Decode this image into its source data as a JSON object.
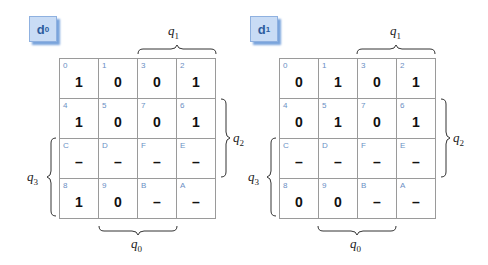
{
  "maps": [
    {
      "name": "d",
      "sub": "0",
      "cells": [
        [
          {
            "idx": "0",
            "val": "1"
          },
          {
            "idx": "1",
            "val": "0"
          },
          {
            "idx": "3",
            "val": "0"
          },
          {
            "idx": "2",
            "val": "1"
          }
        ],
        [
          {
            "idx": "4",
            "val": "1"
          },
          {
            "idx": "5",
            "val": "0"
          },
          {
            "idx": "7",
            "val": "0"
          },
          {
            "idx": "6",
            "val": "1"
          }
        ],
        [
          {
            "idx": "C",
            "val": "–"
          },
          {
            "idx": "D",
            "val": "–"
          },
          {
            "idx": "F",
            "val": "–"
          },
          {
            "idx": "E",
            "val": "–"
          }
        ],
        [
          {
            "idx": "8",
            "val": "1"
          },
          {
            "idx": "9",
            "val": "0"
          },
          {
            "idx": "B",
            "val": "–"
          },
          {
            "idx": "A",
            "val": "–"
          }
        ]
      ]
    },
    {
      "name": "d",
      "sub": "1",
      "cells": [
        [
          {
            "idx": "0",
            "val": "0"
          },
          {
            "idx": "1",
            "val": "1"
          },
          {
            "idx": "3",
            "val": "0"
          },
          {
            "idx": "2",
            "val": "1"
          }
        ],
        [
          {
            "idx": "4",
            "val": "0"
          },
          {
            "idx": "5",
            "val": "1"
          },
          {
            "idx": "7",
            "val": "0"
          },
          {
            "idx": "6",
            "val": "1"
          }
        ],
        [
          {
            "idx": "C",
            "val": "–"
          },
          {
            "idx": "D",
            "val": "–"
          },
          {
            "idx": "F",
            "val": "–"
          },
          {
            "idx": "E",
            "val": "–"
          }
        ],
        [
          {
            "idx": "8",
            "val": "0"
          },
          {
            "idx": "9",
            "val": "0"
          },
          {
            "idx": "B",
            "val": "–"
          },
          {
            "idx": "A",
            "val": "–"
          }
        ]
      ]
    }
  ],
  "vars": {
    "q": "q",
    "q0": "0",
    "q1": "1",
    "q2": "2",
    "q3": "3"
  }
}
